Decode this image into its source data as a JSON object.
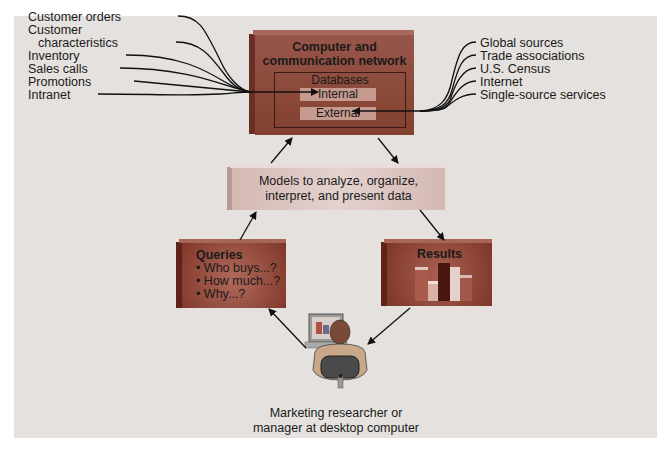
{
  "colors": {
    "background": "#e4e1de",
    "network_box": "#8c4a3c",
    "network_box_top": "#a86a5c",
    "network_box_side": "#6e3024",
    "models_box": "#d9c3bf",
    "queries_box": "#8a3e30",
    "results_box": "#8a3e30",
    "db_inner": "#d3b8b2"
  },
  "left_sources": {
    "items": [
      "Customer orders",
      "Customer",
      "characteristics",
      "Inventory",
      "Sales calls",
      "Promotions",
      "Intranet"
    ]
  },
  "right_sources": {
    "items": [
      "Global sources",
      "Trade associations",
      "U.S. Census",
      "Internet",
      "Single-source services"
    ]
  },
  "network_box": {
    "title_line1": "Computer and",
    "title_line2": "communication network",
    "databases_label": "Databases",
    "internal_label": "Internal",
    "external_label": "External"
  },
  "models_box": {
    "line1": "Models to analyze, organize,",
    "line2": "interpret, and present data"
  },
  "queries_box": {
    "title": "Queries",
    "bullets": [
      "• Who buys...?",
      "• How much...?",
      "• Why...?"
    ]
  },
  "results_box": {
    "title": "Results"
  },
  "user": {
    "caption_line1": "Marketing researcher or",
    "caption_line2": "manager at desktop computer",
    "icon": "person-at-computer-icon"
  }
}
